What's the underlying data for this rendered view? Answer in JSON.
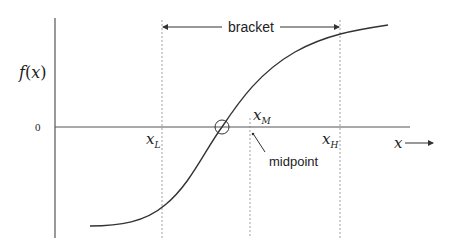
{
  "diagram": {
    "y_axis_label": "f(x)",
    "y_axis_label_f": "f",
    "y_axis_label_open": "(",
    "y_axis_label_x": "x",
    "y_axis_label_close": ")",
    "zero_label": "0",
    "x_axis_label": "x",
    "bracket_label": "bracket",
    "midpoint_label": "midpoint",
    "markers": [
      {
        "name": "x_L",
        "base": "x",
        "sub": "L"
      },
      {
        "name": "x_M",
        "base": "x",
        "sub": "M"
      },
      {
        "name": "x_H",
        "base": "x",
        "sub": "H"
      }
    ],
    "colors": {
      "line": "#333333",
      "dashed": "#888888",
      "background": "#ffffff"
    }
  }
}
